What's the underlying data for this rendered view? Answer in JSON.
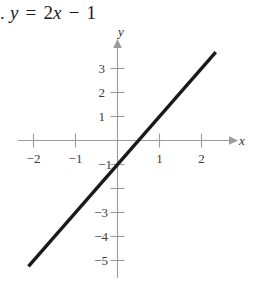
{
  "figure": {
    "width": 253,
    "height": 289,
    "background": "#ffffff"
  },
  "equation": {
    "lead": ".",
    "lhs": "y",
    "equals": "=",
    "coefficient": "2",
    "variable": "x",
    "minus": "−",
    "constant": "1",
    "full_text": "y = 2x − 1"
  },
  "chart_data": {
    "type": "line",
    "title": "y = 2x − 1",
    "xlabel": "x",
    "ylabel": "y",
    "grid": false,
    "legend": null,
    "xlim": [
      -2.6,
      2.8
    ],
    "ylim": [
      -5.6,
      3.6
    ],
    "x_ticks": [
      -2,
      -1,
      1,
      2
    ],
    "x_tick_labels": [
      "−2",
      "−1",
      "1",
      "2"
    ],
    "y_ticks": [
      3,
      2,
      1,
      -1,
      -2,
      -3,
      -4,
      -5
    ],
    "y_tick_labels": [
      "3",
      "2",
      "1",
      "−1",
      "",
      "−3",
      "−4",
      "−5"
    ],
    "series": [
      {
        "name": "y = 2x − 1",
        "slope": 2,
        "intercept": -1,
        "color": "#1a1a1a",
        "line_width": 3.4,
        "x": [
          -2.12,
          2.34
        ],
        "y": [
          -5.24,
          3.68
        ],
        "points": [
          {
            "x": -2.12,
            "y": -5.24
          },
          {
            "x": 0,
            "y": -1
          },
          {
            "x": 0.5,
            "y": 0
          },
          {
            "x": 1,
            "y": 1
          },
          {
            "x": 2.34,
            "y": 3.68
          }
        ]
      }
    ],
    "axis_color": "#9b9b9b",
    "axis_arrows": [
      "x-positive",
      "y-positive"
    ],
    "tick_color": "#9b9b9b"
  },
  "labels": {
    "x_axis": "x",
    "y_axis": "y",
    "x_neg2": "−2",
    "x_neg1": "−1",
    "x_pos1": "1",
    "x_pos2": "2",
    "y_3": "3",
    "y_2": "2",
    "y_1": "1",
    "y_neg1": "−1",
    "y_neg3": "−3",
    "y_neg4": "−4",
    "y_neg5": "−5"
  }
}
